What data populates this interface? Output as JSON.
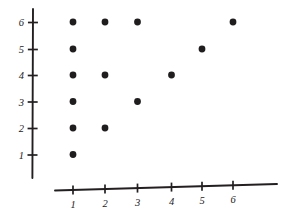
{
  "chart_data": {
    "type": "scatter",
    "title": "",
    "subtitle": "",
    "xlabel": "",
    "ylabel": "",
    "grid": false,
    "legend": false,
    "legend_position": "none",
    "xlim": [
      0,
      7
    ],
    "ylim": [
      0,
      7
    ],
    "x_tick_labels": [
      "1",
      "2",
      "3",
      "4",
      "5",
      "6"
    ],
    "y_tick_labels": [
      "1",
      "2",
      "3",
      "4",
      "5",
      "6"
    ],
    "x_ticks": [
      1,
      2,
      3,
      4,
      5,
      6
    ],
    "y_ticks": [
      1,
      2,
      3,
      4,
      5,
      6
    ],
    "point_count": 14,
    "x": [
      1,
      2,
      3,
      6,
      1,
      5,
      1,
      2,
      4,
      1,
      3,
      1,
      2,
      1
    ],
    "y": [
      6,
      6,
      6,
      6,
      5,
      5,
      4,
      4,
      4,
      3,
      3,
      2,
      2,
      1
    ],
    "points": [
      {
        "x": 1,
        "y": 6
      },
      {
        "x": 2,
        "y": 6
      },
      {
        "x": 3,
        "y": 6
      },
      {
        "x": 6,
        "y": 6
      },
      {
        "x": 1,
        "y": 5
      },
      {
        "x": 5,
        "y": 5
      },
      {
        "x": 1,
        "y": 4
      },
      {
        "x": 2,
        "y": 4
      },
      {
        "x": 4,
        "y": 4
      },
      {
        "x": 1,
        "y": 3
      },
      {
        "x": 3,
        "y": 3
      },
      {
        "x": 1,
        "y": 2
      },
      {
        "x": 2,
        "y": 2
      },
      {
        "x": 1,
        "y": 1
      }
    ],
    "marker": {
      "shape": "circle",
      "color": "#201d1e",
      "radius_px": 3.4
    },
    "axes_style": {
      "color": "#231f20",
      "x_axis_tilted": true,
      "tick_direction": "across"
    }
  },
  "geometry": {
    "y_axis": {
      "x": 33.0,
      "y_top": 9.0,
      "y_bottom": 178.0
    },
    "x_axis": {
      "x_left": 55.0,
      "y_left": 190.5,
      "x_right": 277.0,
      "y_right": 184.0
    },
    "y_tick_pixels": [
      155.0,
      128.5,
      102.0,
      75.5,
      49.5,
      22.5
    ],
    "x_tick_pixels": [
      73.0,
      105.0,
      137.5,
      171.5,
      202.0,
      233.0
    ],
    "tick_half_len_y": 5.0,
    "tick_half_len_x": 4.5,
    "y_label_x": 24.0,
    "x_label_y": 208.0
  }
}
